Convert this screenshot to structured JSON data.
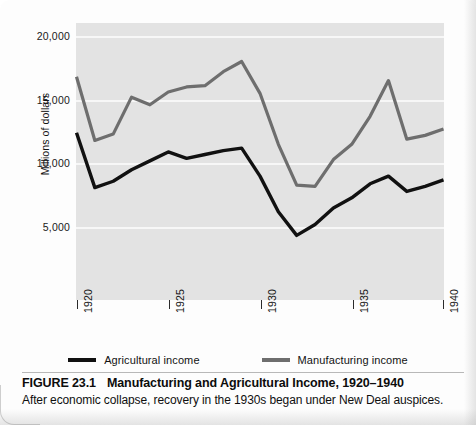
{
  "figure": {
    "number_label": "FIGURE 23.1",
    "title": "Manufacturing and Agricultural Income, 1920–1940",
    "subtitle": "After economic collapse, recovery in the 1930s began under New Deal auspices."
  },
  "legend": {
    "entries": [
      {
        "label": "Agricultural income",
        "color": "#111111",
        "swatch": "agri"
      },
      {
        "label": "Manufacturing income",
        "color": "#6e6e6e",
        "swatch": "manu"
      }
    ]
  },
  "chart_data": {
    "type": "line",
    "title": "Manufacturing and Agricultural Income, 1920–1940",
    "xlabel": "",
    "ylabel": "Millions of dollars",
    "xlim": [
      1920,
      1940
    ],
    "ylim": [
      0,
      20000
    ],
    "yticks": [
      5000,
      10000,
      15000,
      20000
    ],
    "ytick_labels": [
      "5,000",
      "10,000",
      "15,000",
      "20,000"
    ],
    "xticks": [
      1920,
      1925,
      1930,
      1935,
      1940
    ],
    "xtick_labels": [
      "1920",
      "1925",
      "1930",
      "1935",
      "1940"
    ],
    "grid": true,
    "grid_color": "#f7f7f7",
    "plot_background": "#e3e3e3",
    "legend_position": "below",
    "x": [
      1920,
      1921,
      1922,
      1923,
      1924,
      1925,
      1926,
      1927,
      1928,
      1929,
      1930,
      1931,
      1932,
      1933,
      1934,
      1935,
      1936,
      1937,
      1938,
      1939,
      1940
    ],
    "series": [
      {
        "name": "Agricultural income",
        "color": "#111111",
        "values": [
          12400,
          8100,
          8600,
          9500,
          10200,
          10900,
          10400,
          10700,
          11000,
          11200,
          9000,
          6200,
          4350,
          5200,
          6500,
          7300,
          8400,
          9000,
          7800,
          8200,
          8700
        ]
      },
      {
        "name": "Manufacturing income",
        "color": "#6e6e6e",
        "values": [
          16800,
          11800,
          12300,
          15200,
          14600,
          15600,
          16000,
          16100,
          17200,
          18000,
          15500,
          11500,
          8300,
          8200,
          10300,
          11500,
          13700,
          16500,
          11900,
          12200,
          12700
        ]
      }
    ]
  }
}
